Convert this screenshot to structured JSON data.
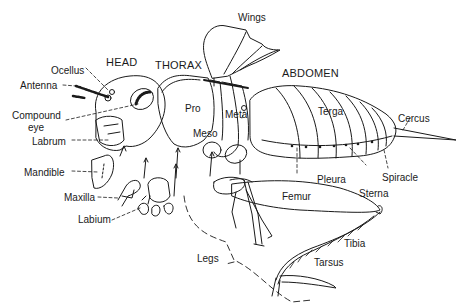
{
  "diagram": {
    "ink_color": "#1a1a1a",
    "background": "#ffffff",
    "sections": {
      "head": "HEAD",
      "thorax": "THORAX",
      "abdomen": "ABDOMEN"
    },
    "labels": {
      "wings": "Wings",
      "ocellus": "Ocellus",
      "antenna": "Antenna",
      "compound_eye_1": "Compound",
      "compound_eye_2": "eye",
      "labrum": "Labrum",
      "mandible": "Mandible",
      "maxilla": "Maxilla",
      "labium": "Labium",
      "pro": "Pro",
      "meso": "Meso",
      "meta": "Meta",
      "terga": "Terga",
      "cercus": "Cercus",
      "pleura": "Pleura",
      "sterna": "Sterna",
      "spiracle": "Spiracle",
      "femur": "Femur",
      "tibia": "Tibia",
      "tarsus": "Tarsus",
      "legs": "Legs"
    }
  }
}
